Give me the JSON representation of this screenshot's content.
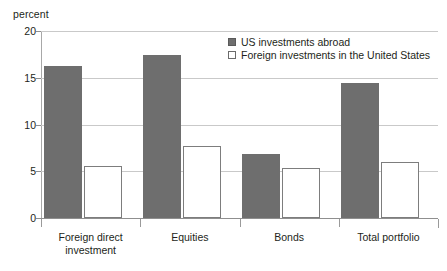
{
  "chart_data": {
    "type": "bar",
    "title": "",
    "subtitle": "",
    "xlabel": "",
    "ylabel": "percent",
    "ylim": [
      0,
      20
    ],
    "yticks": [
      0,
      5,
      10,
      15,
      20
    ],
    "ytick_labels": [
      "0",
      "5",
      "10",
      "15",
      "20"
    ],
    "grid": true,
    "grid_axis": "y",
    "legend_position": "top-right",
    "categories": [
      "Foreign direct\ninvestment",
      "Equities",
      "Bonds",
      "Total portfolio"
    ],
    "series": [
      {
        "name": "US investments abroad",
        "color": "#6e6e6e",
        "style": "filled",
        "values": [
          16.3,
          17.4,
          6.8,
          14.4
        ]
      },
      {
        "name": "Foreign investments in the United States",
        "color": "#ffffff",
        "style": "hollow",
        "values": [
          5.6,
          7.7,
          5.3,
          6.0
        ]
      }
    ]
  },
  "legend": {
    "items": [
      {
        "label": "US investments abroad",
        "swatch": "filled-square-icon"
      },
      {
        "label": "Foreign investments in the United States",
        "swatch": "hollow-square-icon"
      }
    ]
  },
  "colors": {
    "series_filled": "#6e6e6e",
    "series_hollow": "#ffffff",
    "gridline": "#c9c9c9",
    "axis": "#8f8f8f",
    "text": "#231f20",
    "background": "#ffffff"
  }
}
